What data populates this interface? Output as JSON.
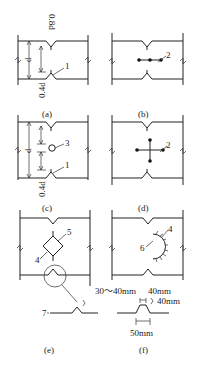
{
  "panels": {
    "a": {
      "caption": "(a)",
      "dim_top": "0.8d",
      "dim_d": "d",
      "dim_bottom": "0.4d",
      "callout_1": "1"
    },
    "b": {
      "caption": "(b)",
      "callout_2": "2"
    },
    "c": {
      "caption": "(c)",
      "dim_d": "d",
      "dim_bottom": "0.4d",
      "callout_3": "3",
      "callout_1": "1"
    },
    "d": {
      "caption": "(d)",
      "callout_2": "2"
    },
    "e": {
      "caption": "(e)",
      "callout_5": "5",
      "callout_4": "4",
      "callout_7": "7"
    },
    "f": {
      "caption": "(f)",
      "callout_4": "4",
      "callout_6": "6",
      "dim_range": "30～40mm",
      "dim_width_top": "40mm",
      "dim_height": "40mm",
      "dim_width_base": "50mm"
    }
  }
}
